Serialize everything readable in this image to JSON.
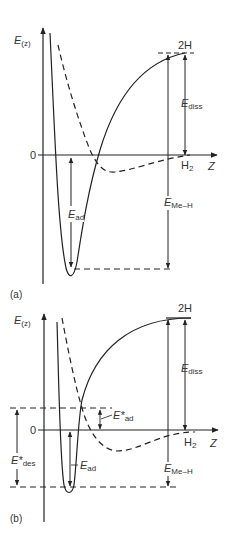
{
  "figure": {
    "panels": [
      {
        "id": "a",
        "panel_label": "(a)",
        "y_axis_label": "E",
        "y_axis_sub": "(z)",
        "x_axis_label": "Z",
        "zero_label": "0",
        "top_level_label": "2H",
        "molecule_label": "H",
        "molecule_sub": "2",
        "energies": [
          {
            "main": "E",
            "sub": "diss"
          },
          {
            "main": "E",
            "sub": "Me–H"
          },
          {
            "main": "E",
            "sub": "ad"
          }
        ]
      },
      {
        "id": "b",
        "panel_label": "(b)",
        "y_axis_label": "E",
        "y_axis_sub": "(z)",
        "x_axis_label": "Z",
        "zero_label": "0",
        "top_level_label": "2H",
        "molecule_label": "H",
        "molecule_sub": "2",
        "energies": [
          {
            "main": "E",
            "sub": "diss"
          },
          {
            "main": "E",
            "sub": "Me–H"
          },
          {
            "main": "E",
            "sub": "ad"
          },
          {
            "main": "E*",
            "sub": "ad"
          },
          {
            "main": "E*",
            "sub": "des"
          }
        ]
      }
    ],
    "line_color": "#222222"
  }
}
